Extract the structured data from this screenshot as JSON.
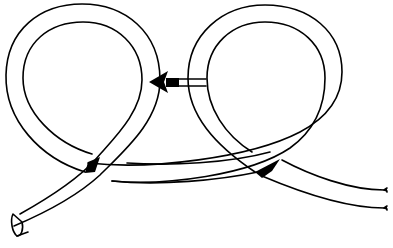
{
  "diagram": {
    "colors": {
      "background": "#ffffff",
      "line": "#000000",
      "arrow": "#000000"
    },
    "elements": [
      {
        "name": "left-loop",
        "type": "rope-loop"
      },
      {
        "name": "right-loop",
        "type": "rope-loop"
      },
      {
        "name": "rope-end-cut",
        "type": "rope-end",
        "position": "bottom-left"
      },
      {
        "name": "rope-standing-part",
        "type": "rope-tail",
        "position": "right",
        "ends": "frayed"
      },
      {
        "name": "direction-arrow",
        "type": "arrow",
        "direction": "left"
      }
    ]
  }
}
